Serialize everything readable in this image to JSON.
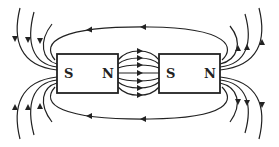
{
  "diagram": {
    "colors": {
      "stroke": "#222222",
      "background": "#ffffff"
    },
    "magnets": [
      {
        "id": "left",
        "labels": {
          "left": "S",
          "right": "N"
        },
        "x": 57,
        "y": 54,
        "width": 61,
        "height": 39
      },
      {
        "id": "right",
        "labels": {
          "left": "S",
          "right": "N"
        },
        "x": 159,
        "y": 54,
        "width": 61,
        "height": 39
      }
    ],
    "field_lines": {
      "gap_lines": 7,
      "gap_direction": "left-to-right",
      "outer_loops": [
        "top",
        "bottom"
      ],
      "outer_loop_direction": "right-to-left",
      "left_fringe_lines_top": 3,
      "left_fringe_lines_bottom": 3,
      "right_fringe_lines_top": 3,
      "right_fringe_lines_bottom": 3
    }
  }
}
